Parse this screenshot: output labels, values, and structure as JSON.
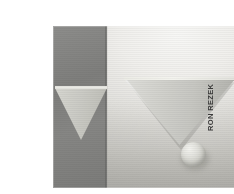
{
  "page": {
    "background_color": "#ffffff",
    "width": 234,
    "height": 194
  },
  "photo": {
    "alt_description": "Black and white studio photograph of an inverted pyramid / triangular wedge mounted on a light wall, its apex resting on a small sphere, with a second inverted triangle on a dark panel at the left",
    "frame": {
      "left": 13,
      "top": 10,
      "width": 182,
      "height": 162
    },
    "dark_panel": {
      "name": "dark-panel",
      "color": "#7e7e7c",
      "left": 0,
      "top": 0,
      "width": 54,
      "height": 162
    },
    "backdrop": {
      "name": "light-backdrop",
      "highlight_color": "#f7f7f5",
      "shadow_color": "#c2c1bc"
    },
    "shapes": [
      {
        "name": "left-inverted-triangle",
        "type": "inverted-triangle",
        "fill": "#cbcbc5",
        "top_edge": "#e9e9e3"
      },
      {
        "name": "main-inverted-triangle",
        "type": "inverted-triangle",
        "fill": "#c7c7c2",
        "top_edge": "#f3f3ee",
        "shadow": "#787772"
      },
      {
        "name": "sphere",
        "type": "sphere",
        "highlight": "#f3f3ef",
        "fill": "#d2d2cc",
        "shade": "#a8a8a2"
      }
    ]
  },
  "credit": {
    "text": "RON REZEK",
    "orientation": "vertical",
    "color": "#3a3a3a"
  }
}
